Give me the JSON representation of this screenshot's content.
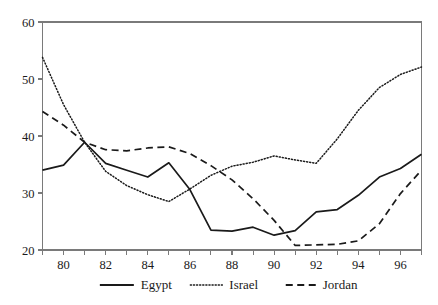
{
  "chart_data": {
    "type": "line",
    "title": "",
    "subtitle": "",
    "xlabel": "",
    "ylabel": "",
    "xlim": [
      79,
      97
    ],
    "ylim": [
      20,
      60
    ],
    "grid": false,
    "legend_position": "bottom",
    "x": [
      79,
      80,
      81,
      82,
      83,
      84,
      85,
      86,
      87,
      88,
      89,
      90,
      91,
      92,
      93,
      94,
      95,
      96,
      97
    ],
    "x_tick_labels": [
      "80",
      "82",
      "84",
      "86",
      "88",
      "90",
      "92",
      "94",
      "96"
    ],
    "x_tick_values": [
      80,
      82,
      84,
      86,
      88,
      90,
      92,
      94,
      96
    ],
    "y_tick_labels": [
      "20",
      "30",
      "40",
      "50",
      "60"
    ],
    "y_tick_values": [
      20,
      30,
      40,
      50,
      60
    ],
    "series": [
      {
        "name": "Egypt",
        "style": "solid",
        "color": "#1a1a1a",
        "values": [
          34.0,
          34.9,
          38.9,
          35.2,
          34.0,
          32.8,
          35.3,
          30.6,
          23.5,
          23.3,
          24.0,
          22.6,
          23.4,
          26.7,
          27.1,
          29.6,
          32.8,
          34.3,
          36.8
        ]
      },
      {
        "name": "Israel",
        "style": "dotted",
        "color": "#1a1a1a",
        "values": [
          53.8,
          45.5,
          38.9,
          33.8,
          31.3,
          29.7,
          28.5,
          30.7,
          33.1,
          34.7,
          35.4,
          36.5,
          35.8,
          35.2,
          39.5,
          44.5,
          48.5,
          50.8,
          52.1
        ]
      },
      {
        "name": "Jordan",
        "style": "dashed",
        "color": "#1a1a1a",
        "values": [
          44.3,
          41.9,
          38.9,
          37.6,
          37.4,
          37.9,
          38.1,
          36.9,
          34.8,
          32.3,
          29.0,
          25.2,
          20.8,
          20.9,
          21.0,
          21.6,
          24.6,
          29.9,
          34.0
        ]
      }
    ]
  },
  "legend": {
    "items": [
      {
        "label": "Egypt",
        "style": "solid"
      },
      {
        "label": "Israel",
        "style": "dotted"
      },
      {
        "label": "Jordan",
        "style": "dashed"
      }
    ]
  }
}
